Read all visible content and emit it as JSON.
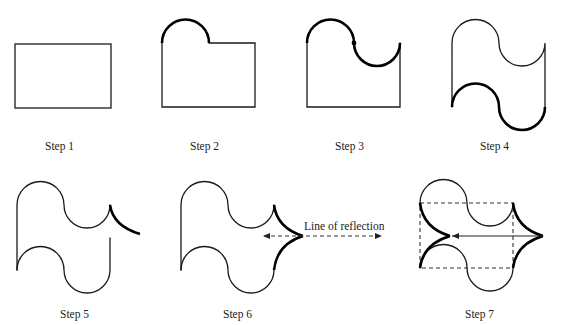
{
  "figure": {
    "colors": {
      "stroke": "#1a1a1a",
      "background": "#ffffff"
    },
    "steps": [
      {
        "id": 1,
        "label": "Step 1"
      },
      {
        "id": 2,
        "label": "Step 2"
      },
      {
        "id": 3,
        "label": "Step 3"
      },
      {
        "id": 4,
        "label": "Step 4"
      },
      {
        "id": 5,
        "label": "Step 5"
      },
      {
        "id": 6,
        "label": "Step 6",
        "annotation": "Line of reflection"
      },
      {
        "id": 7,
        "label": "Step 7"
      }
    ]
  }
}
